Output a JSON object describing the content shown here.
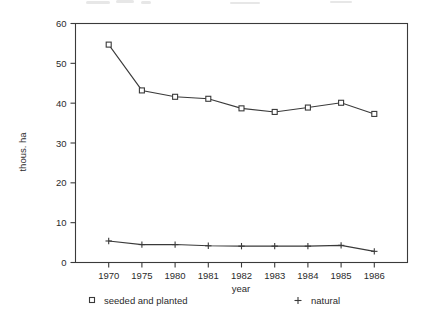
{
  "chart_data": {
    "type": "line",
    "title": "",
    "xlabel": "year",
    "ylabel": "thous. ha",
    "categories": [
      "1970",
      "1975",
      "1980",
      "1981",
      "1982",
      "1983",
      "1984",
      "1985",
      "1986"
    ],
    "yticks": [
      0,
      10,
      20,
      30,
      40,
      50,
      60
    ],
    "ylim": [
      0,
      60
    ],
    "grid": false,
    "legend_position": "bottom",
    "series": [
      {
        "name": "seeded and planted",
        "marker": "square",
        "values": [
          54.7,
          43.2,
          41.6,
          41.1,
          38.7,
          37.8,
          38.9,
          40.1,
          37.3
        ]
      },
      {
        "name": "natural",
        "marker": "plus",
        "values": [
          5.4,
          4.5,
          4.5,
          4.2,
          4.1,
          4.1,
          4.1,
          4.3,
          2.8
        ]
      }
    ]
  },
  "axes": {
    "y_label": "thous. ha",
    "x_label": "year",
    "y_tick_labels": [
      "60",
      "50",
      "40",
      "30",
      "20",
      "10",
      "0"
    ],
    "x_tick_labels": [
      "1970",
      "1975",
      "1980",
      "1981",
      "1982",
      "1983",
      "1984",
      "1985",
      "1986"
    ]
  },
  "legend": {
    "items": [
      {
        "marker_glyph": "square-marker",
        "label": "seeded and planted"
      },
      {
        "marker_glyph": "plus-marker",
        "label": "natural"
      }
    ]
  },
  "colors": {
    "ink": "#3a3a3a",
    "text": "#2b2b2b",
    "background": "#ffffff"
  }
}
